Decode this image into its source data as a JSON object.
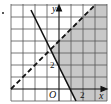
{
  "diagram": {
    "type": "coordinate-plane-inequality",
    "grid": {
      "x_min": -4,
      "x_max": 4,
      "y_min": -1,
      "y_max": 7,
      "unit_px": 12
    },
    "axes": {
      "x_label": "x",
      "y_label": "y",
      "origin_label": "O",
      "x_tick_label": "2",
      "y_tick_label": "2"
    },
    "lines": [
      {
        "name": "solid-line",
        "style": "solid",
        "equation": "y = -2x + 2"
      },
      {
        "name": "dashed-line",
        "style": "dashed",
        "equation": "y = x + 4"
      }
    ],
    "shaded_region": "y >= -2x + 2 and y < x + 4",
    "colors": {
      "shade": "#c8c8c8",
      "grid": "#555555",
      "line": "#111111"
    }
  }
}
